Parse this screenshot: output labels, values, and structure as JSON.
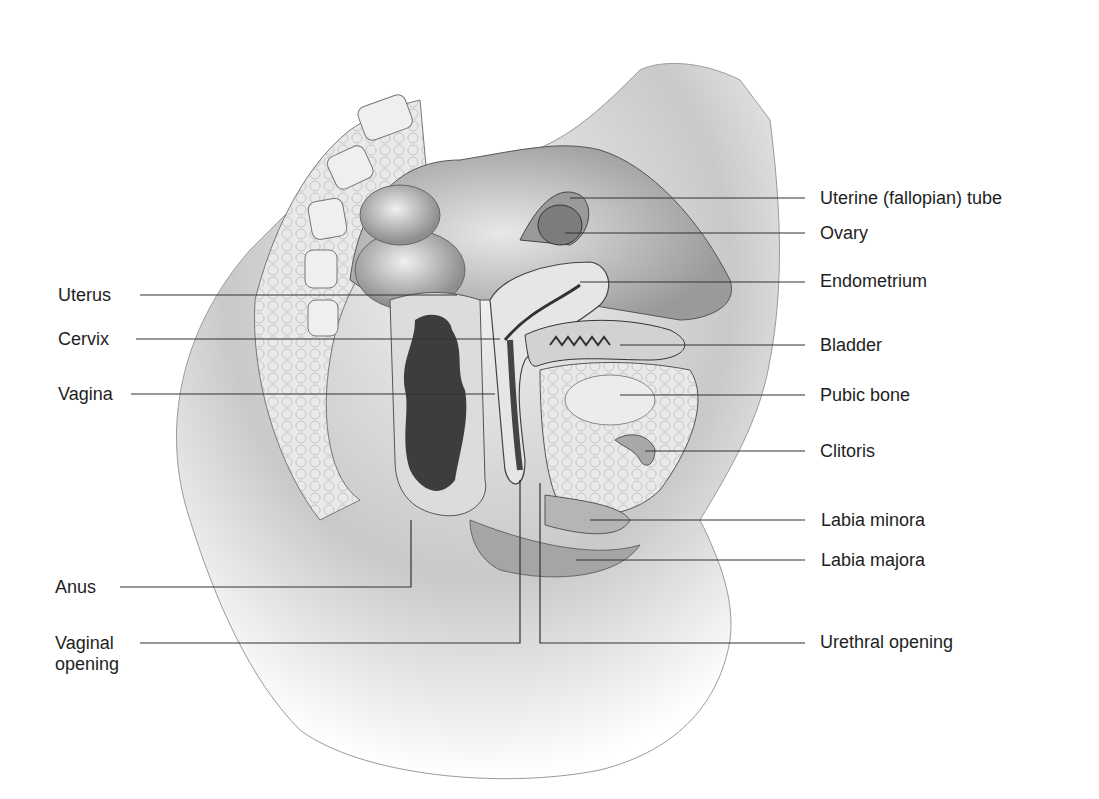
{
  "figure": {
    "colors": {
      "background": "#ffffff",
      "text": "#1e1e1e",
      "leader_line": "#333333",
      "tissue_light": "#e6e6e6",
      "tissue_mid": "#b8b8b8",
      "tissue_dark": "#3a3a3a"
    }
  },
  "labels": {
    "left": [
      {
        "id": "uterus",
        "text": "Uterus"
      },
      {
        "id": "cervix",
        "text": "Cervix"
      },
      {
        "id": "vagina",
        "text": "Vagina"
      },
      {
        "id": "anus",
        "text": "Anus"
      },
      {
        "id": "vaginal_opening",
        "text": "Vaginal opening"
      }
    ],
    "right": [
      {
        "id": "uterine_tube",
        "text": "Uterine (fallopian) tube"
      },
      {
        "id": "ovary",
        "text": "Ovary"
      },
      {
        "id": "endometrium",
        "text": "Endometrium"
      },
      {
        "id": "bladder",
        "text": "Bladder"
      },
      {
        "id": "pubic_bone",
        "text": "Pubic bone"
      },
      {
        "id": "clitoris",
        "text": "Clitoris"
      },
      {
        "id": "labia_minora",
        "text": "Labia minora"
      },
      {
        "id": "labia_majora",
        "text": "Labia majora"
      },
      {
        "id": "urethral_opening",
        "text": "Urethral opening"
      }
    ]
  }
}
